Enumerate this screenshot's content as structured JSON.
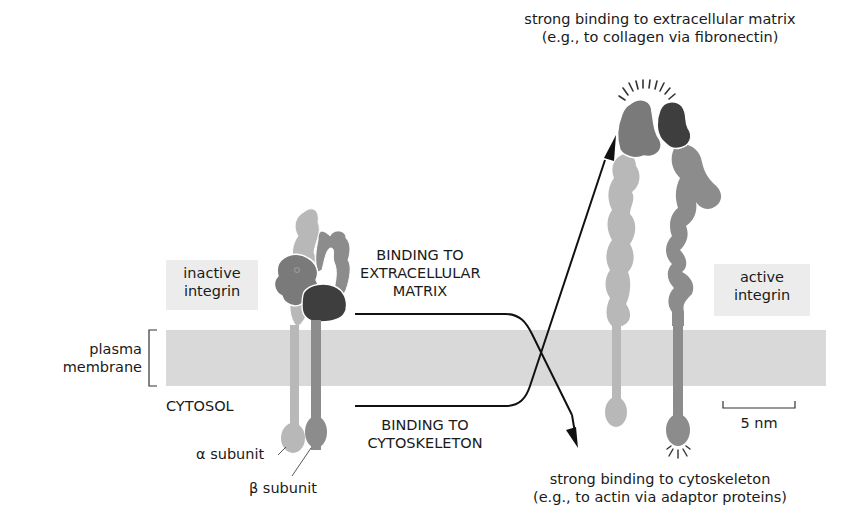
{
  "colors": {
    "membrane": "#d9d9d9",
    "label_box": "#ececec",
    "alpha_light": "#b8b8b8",
    "beta_mid": "#8c8c8c",
    "alpha_head": "#7a7a7a",
    "beta_head_dark": "#3e3e3e",
    "arrow": "#111111"
  },
  "labels": {
    "inactive_integrin": [
      "inactive",
      "integrin"
    ],
    "active_integrin": [
      "active",
      "integrin"
    ],
    "plasma_membrane": [
      "plasma",
      "membrane"
    ],
    "cytosol": "CYTOSOL",
    "alpha_subunit": "α subunit",
    "beta_subunit": "β subunit",
    "binding_ecm": [
      "BINDING TO",
      "EXTRACELLULAR",
      "MATRIX"
    ],
    "binding_cytoskeleton": [
      "BINDING TO",
      "CYTOSKELETON"
    ],
    "top_caption": [
      "strong binding to extracellular matrix",
      "(e.g., to collagen via fibronectin)"
    ],
    "bottom_caption": [
      "strong binding to cytoskeleton",
      "(e.g., to actin via adaptor proteins)"
    ],
    "scale_bar": "5 nm"
  }
}
